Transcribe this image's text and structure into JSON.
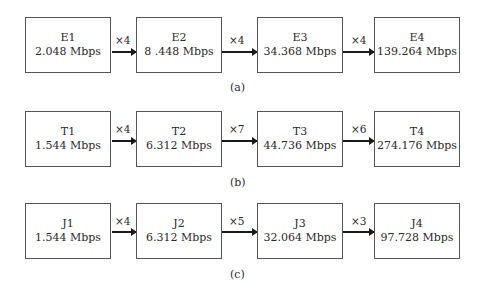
{
  "rows": [
    {
      "caption": "(a)",
      "boxes": [
        {
          "name": "E1",
          "rate": "2.048 Mbps"
        },
        {
          "name": "E2",
          "rate": "8 .448 Mbps"
        },
        {
          "name": "E3",
          "rate": "34.368 Mbps"
        },
        {
          "name": "E4",
          "rate": "139.264 Mbps"
        }
      ],
      "multipliers": [
        "×4",
        "×4",
        "×4"
      ]
    },
    {
      "caption": "(b)",
      "boxes": [
        {
          "name": "T1",
          "rate": "1.544 Mbps"
        },
        {
          "name": "T2",
          "rate": "6.312 Mbps"
        },
        {
          "name": "T3",
          "rate": "44.736 Mbps"
        },
        {
          "name": "T4",
          "rate": "274.176 Mbps"
        }
      ],
      "multipliers": [
        "×4",
        "×7",
        "×6"
      ]
    },
    {
      "caption": "(c)",
      "boxes": [
        {
          "name": "J1",
          "rate": "1.544 Mbps"
        },
        {
          "name": "J2",
          "rate": "6.312 Mbps"
        },
        {
          "name": "J3",
          "rate": "32.064 Mbps"
        },
        {
          "name": "J4",
          "rate": "97.728 Mbps"
        }
      ],
      "multipliers": [
        "×4",
        "×5",
        "×3"
      ]
    }
  ]
}
